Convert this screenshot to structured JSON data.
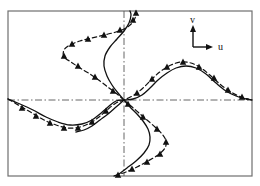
{
  "figure": {
    "name": "velocity-field-mode-shape-plot",
    "background_color": "#ffffff",
    "frame": {
      "color": "#6f6f6f",
      "x": 8,
      "y": 11,
      "width": 244,
      "height": 165
    },
    "axes": {
      "style": "dash-dot",
      "color": "#555555",
      "origin_x": 124,
      "origin_y": 100,
      "horizontal_label": "u",
      "vertical_label": "v"
    },
    "legend": {
      "name": "uv-axis-indicator",
      "corner_x": 193,
      "corner_y": 47,
      "u_label": "u",
      "v_label": "v",
      "u_label_x": 218,
      "u_label_y": 50,
      "v_label_x": 190,
      "v_label_y": 23,
      "arrow_color": "#111111"
    },
    "curves": [
      {
        "name": "solid-curve",
        "line_style": "solid",
        "color": "#111111",
        "width": 1.3,
        "has_markers": false,
        "points": [
          [
            8,
            99
          ],
          [
            20,
            104
          ],
          [
            33,
            110
          ],
          [
            46,
            117
          ],
          [
            58,
            122
          ],
          [
            70,
            125
          ],
          [
            82,
            124
          ],
          [
            92,
            120
          ],
          [
            100,
            114
          ],
          [
            108,
            107
          ],
          [
            116,
            101
          ],
          [
            124,
            100
          ],
          [
            133,
            99
          ],
          [
            142,
            95
          ],
          [
            150,
            88
          ],
          [
            158,
            80
          ],
          [
            167,
            73
          ],
          [
            176,
            68
          ],
          [
            186,
            66
          ],
          [
            196,
            68
          ],
          [
            206,
            74
          ],
          [
            216,
            83
          ],
          [
            226,
            91
          ],
          [
            236,
            96
          ],
          [
            246,
            99
          ],
          [
            252,
            100
          ]
        ]
      },
      {
        "name": "solid-curve-second-branch",
        "line_style": "solid",
        "color": "#111111",
        "width": 1.3,
        "has_markers": false,
        "points": [
          [
            124,
            100
          ],
          [
            118,
            93
          ],
          [
            112,
            85
          ],
          [
            107,
            76
          ],
          [
            104,
            66
          ],
          [
            105,
            56
          ],
          [
            110,
            47
          ],
          [
            117,
            39
          ],
          [
            124,
            31
          ],
          [
            129,
            23
          ],
          [
            131,
            15
          ],
          [
            130,
            11
          ]
        ]
      },
      {
        "name": "solid-curve-third-branch",
        "line_style": "solid",
        "color": "#111111",
        "width": 1.3,
        "has_markers": false,
        "points": [
          [
            124,
            100
          ],
          [
            130,
            107
          ],
          [
            137,
            114
          ],
          [
            143,
            121
          ],
          [
            148,
            129
          ],
          [
            150,
            137
          ],
          [
            149,
            145
          ],
          [
            144,
            153
          ],
          [
            136,
            161
          ],
          [
            127,
            168
          ],
          [
            119,
            174
          ],
          [
            114,
            176
          ]
        ]
      },
      {
        "name": "dashed-curve",
        "line_style": "dashed",
        "color": "#111111",
        "width": 1.2,
        "has_markers": true,
        "marker_shape": "filled-triangle",
        "points": [
          [
            8,
            99
          ],
          [
            20,
            106
          ],
          [
            32,
            113
          ],
          [
            44,
            120
          ],
          [
            56,
            125
          ],
          [
            68,
            128
          ],
          [
            80,
            127
          ],
          [
            90,
            123
          ],
          [
            99,
            117
          ],
          [
            107,
            110
          ],
          [
            116,
            103
          ],
          [
            124,
            100
          ],
          [
            134,
            95
          ],
          [
            143,
            88
          ],
          [
            152,
            79
          ],
          [
            161,
            71
          ],
          [
            171,
            65
          ],
          [
            181,
            62
          ],
          [
            191,
            63
          ],
          [
            201,
            68
          ],
          [
            211,
            76
          ],
          [
            221,
            85
          ],
          [
            231,
            92
          ],
          [
            241,
            97
          ],
          [
            252,
            100
          ]
        ],
        "markers": [
          [
            22,
            108
          ],
          [
            36,
            116
          ],
          [
            50,
            123
          ],
          [
            64,
            128
          ],
          [
            78,
            128
          ],
          [
            92,
            122
          ],
          [
            106,
            111
          ],
          [
            137,
            93
          ],
          [
            152,
            79
          ],
          [
            167,
            67
          ],
          [
            183,
            62
          ],
          [
            199,
            67
          ],
          [
            214,
            78
          ],
          [
            228,
            90
          ],
          [
            242,
            97
          ]
        ]
      },
      {
        "name": "dashed-curve-second-branch",
        "line_style": "dashed",
        "color": "#111111",
        "width": 1.2,
        "has_markers": true,
        "marker_shape": "filled-triangle",
        "points": [
          [
            124,
            100
          ],
          [
            117,
            94
          ],
          [
            109,
            88
          ],
          [
            100,
            81
          ],
          [
            90,
            74
          ],
          [
            80,
            68
          ],
          [
            71,
            62
          ],
          [
            64,
            57
          ],
          [
            64,
            50
          ],
          [
            70,
            45
          ],
          [
            80,
            41
          ],
          [
            92,
            38
          ],
          [
            104,
            35
          ],
          [
            116,
            32
          ],
          [
            126,
            28
          ],
          [
            133,
            22
          ],
          [
            136,
            15
          ],
          [
            136,
            11
          ]
        ],
        "markers": [
          [
            113,
            91
          ],
          [
            95,
            77
          ],
          [
            78,
            66
          ],
          [
            64,
            56
          ],
          [
            72,
            44
          ],
          [
            88,
            39
          ],
          [
            104,
            35
          ],
          [
            120,
            30
          ],
          [
            133,
            20
          ],
          [
            136,
            13
          ]
        ]
      },
      {
        "name": "dashed-curve-third-branch",
        "line_style": "dashed",
        "color": "#111111",
        "width": 1.2,
        "has_markers": true,
        "marker_shape": "filled-triangle",
        "points": [
          [
            124,
            100
          ],
          [
            131,
            106
          ],
          [
            139,
            113
          ],
          [
            147,
            120
          ],
          [
            155,
            127
          ],
          [
            162,
            134
          ],
          [
            166,
            141
          ],
          [
            165,
            148
          ],
          [
            158,
            155
          ],
          [
            148,
            161
          ],
          [
            137,
            167
          ],
          [
            126,
            172
          ],
          [
            117,
            175
          ]
        ],
        "markers": [
          [
            128,
            104
          ],
          [
            143,
            117
          ],
          [
            157,
            129
          ],
          [
            166,
            142
          ],
          [
            160,
            154
          ],
          [
            147,
            162
          ],
          [
            132,
            169
          ],
          [
            118,
            175
          ]
        ]
      },
      {
        "name": "solid-curve-lower-left-tail",
        "line_style": "solid",
        "color": "#111111",
        "width": 1.3,
        "has_markers": false,
        "points": [
          [
            124,
            100
          ],
          [
            116,
            107
          ],
          [
            108,
            114
          ],
          [
            100,
            120
          ],
          [
            92,
            126
          ],
          [
            84,
            130
          ],
          [
            76,
            132
          ]
        ]
      }
    ],
    "marker_size": 6.5,
    "marker_color": "#111111"
  }
}
